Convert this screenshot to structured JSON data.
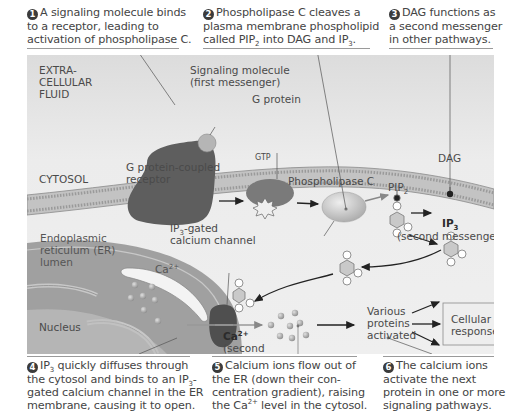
{
  "captions": {
    "step1": {
      "num": "1",
      "lines": [
        "A signaling molecule binds",
        "to a receptor, leading to",
        "activation of phospholipase C."
      ]
    },
    "step2": {
      "num": "2",
      "line1": "Phospholipase C cleaves a",
      "line2": "plasma membrane phospholipid",
      "line3_a": "called PIP",
      "line3_sub": "2",
      "line3_b": " into DAG and IP",
      "line3_sub2": "3",
      "line3_c": "."
    },
    "step3": {
      "num": "3",
      "lines": [
        "DAG functions as",
        "a second messenger",
        "in other pathways."
      ]
    },
    "step4": {
      "num": "4",
      "l1_a": "IP",
      "l1_sub": "3",
      "l1_b": " quickly diffuses through",
      "l2_a": "the cytosol and binds to an IP",
      "l2_sub": "3",
      "l2_b": "-",
      "l3": "gated calcium channel in the ER",
      "l4": "membrane, causing it to open."
    },
    "step5": {
      "num": "5",
      "l1": "Calcium ions flow out of",
      "l2": "the ER (down their con-",
      "l3": "centration gradient), raising",
      "l4_a": "the Ca",
      "l4_sup": "2+",
      "l4_b": " level in the cytosol."
    },
    "step6": {
      "num": "6",
      "lines": [
        "The calcium ions",
        "activate the next",
        "protein in one or more",
        "signaling pathways."
      ]
    }
  },
  "diagram": {
    "regions": {
      "extracellular": [
        "EXTRA-",
        "CELLULAR",
        "FLUID"
      ],
      "cytosol": "CYTOSOL",
      "er": [
        "Endoplasmic",
        "reticulum (ER)",
        "lumen"
      ],
      "nucleus": "Nucleus"
    },
    "labels": {
      "signaling_molecule": [
        "Signaling molecule",
        "(first messenger)"
      ],
      "g_protein": "G protein",
      "gtp": "GTP",
      "gpcr": [
        "G protein-coupled",
        "receptor"
      ],
      "phospholipase_c": "Phospholipase C",
      "pip2_a": "PIP",
      "pip2_sub": "2",
      "dag": "DAG",
      "ip3_a": "IP",
      "ip3_sub": "3",
      "ip3_note": "(second messenger)",
      "ip3_channel_a": "IP",
      "ip3_channel_sub": "3",
      "ip3_channel_b": "-gated",
      "ip3_channel_c": "calcium channel",
      "ca_er_a": "Ca",
      "ca_er_sup": "2+",
      "ca_cyt_a": "Ca",
      "ca_cyt_sup": "2+",
      "ca_cyt_note": [
        "(second",
        "messenger)"
      ],
      "proteins": [
        "Various",
        "proteins",
        "activated"
      ],
      "responses": [
        "Cellular",
        "responses"
      ]
    },
    "colors": {
      "panel_bg": "#e9e9e9",
      "membrane": "#b9b9b9",
      "receptor": "#5f5f5f",
      "g_protein": "#7a7a7a",
      "plc": "#c9c9c9",
      "er": "#9b9b9b",
      "channel": "#4e4e4e",
      "ion": "#a8a8a8"
    }
  }
}
